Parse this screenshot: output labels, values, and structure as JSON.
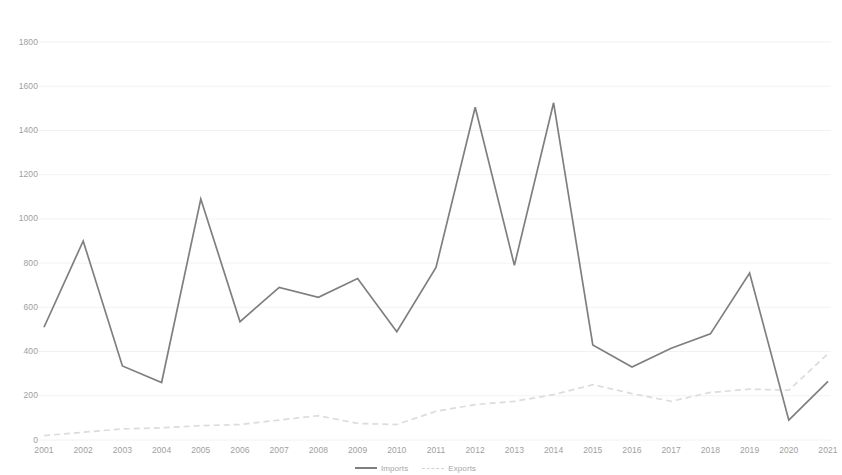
{
  "chart_data": {
    "type": "line",
    "title": "",
    "xlabel": "",
    "ylabel": "",
    "x": [
      2001,
      2002,
      2003,
      2004,
      2005,
      2006,
      2007,
      2008,
      2009,
      2010,
      2011,
      2012,
      2013,
      2014,
      2015,
      2016,
      2017,
      2018,
      2019,
      2020,
      2021
    ],
    "categories": [
      "2001",
      "2002",
      "2003",
      "2004",
      "2005",
      "2006",
      "2007",
      "2008",
      "2009",
      "2010",
      "2011",
      "2012",
      "2013",
      "2014",
      "2015",
      "2016",
      "2017",
      "2018",
      "2019",
      "2020",
      "2021"
    ],
    "series": [
      {
        "name": "Imports",
        "style": "solid",
        "color": "#7f7f7f",
        "values": [
          510,
          900,
          335,
          260,
          1090,
          535,
          690,
          645,
          730,
          490,
          780,
          1505,
          790,
          1525,
          430,
          330,
          415,
          480,
          755,
          90,
          265
        ]
      },
      {
        "name": "Exports",
        "style": "dashed",
        "color": "#dcdcdc",
        "values": [
          20,
          35,
          50,
          55,
          65,
          70,
          90,
          110,
          75,
          70,
          130,
          160,
          175,
          205,
          250,
          210,
          175,
          215,
          230,
          225,
          390
        ]
      }
    ],
    "ylim": [
      0,
      1800
    ],
    "ytick_step": 200,
    "yticks": [
      0,
      200,
      400,
      600,
      800,
      1000,
      1200,
      1400,
      1600,
      1800
    ],
    "ytick_labels": [
      "0",
      "200",
      "400",
      "600",
      "800",
      "1000",
      "1200",
      "1400",
      "1600",
      "1800"
    ],
    "xlim": [
      2001,
      2021
    ],
    "grid": true,
    "grid_axis": "y",
    "legend_position": "bottom-center",
    "legend_entries": [
      "Imports",
      "Exports"
    ]
  },
  "legend": {
    "imports_label": "Imports",
    "exports_label": "Exports"
  },
  "colors": {
    "imports": "#7f7f7f",
    "exports": "#dcdcdc",
    "grid": "#f2f2f2",
    "axis_text": "#a0a0a0",
    "background": "#ffffff"
  }
}
